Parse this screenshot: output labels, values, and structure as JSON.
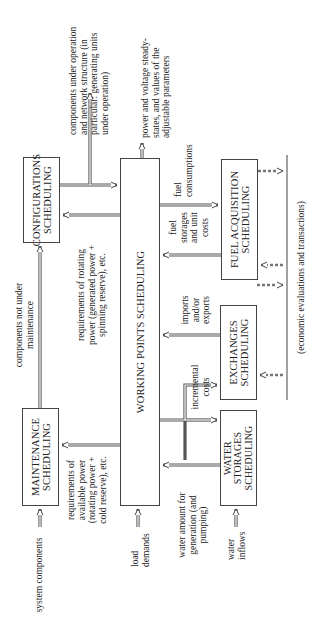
{
  "boxes": {
    "configurations": "CONFIGURATIONS\nSCHEDULING",
    "maintenance": "MAINTENANCE\nSCHEDULING",
    "working_points": "WORKING POINTS SCHEDULING",
    "fuel_acquisition": "FUEL ACQUISITION\nSCHEDULING",
    "exchanges": "EXCHANGES\nSCHEDULING",
    "water_storages": "WATER\nSTORAGES\nSCHEDULING"
  },
  "labels": {
    "components_under_operation": "components under operation\nand network structure (in\nparticular: generating units\nunder operation)",
    "power_voltage": "power and voltage steady-\nstates, and values of the\nadjustable parameters",
    "components_not_under_maintenance": "components not under\nmaintenance",
    "rotating_power_req": "requirements of rotating\npower (generated power +\nspinning reserve), etc.",
    "available_power_req": "requirements of\navailable power\n(rotating power +\ncold reserve), etc.",
    "system_components": "system components",
    "load_demands": "load\ndemands",
    "water_amount": "water amount for\ngeneration (and\npumping)",
    "water_inflows": "water\ninflows",
    "fuel_consumptions": "fuel\nconsumptions",
    "fuel_storages": "fuel\nstorages\nand unit\ncosts",
    "imports_exports": "imports\nand/or\nexports",
    "incremental_costs": "incremental\ncosts",
    "economic": "(economic evaluations and transactions)"
  }
}
